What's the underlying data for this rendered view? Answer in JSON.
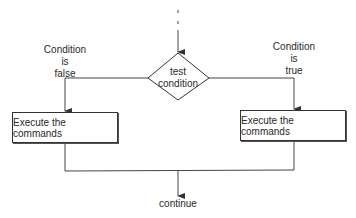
{
  "diagram": {
    "decision": {
      "line1": "test",
      "line2": "condition"
    },
    "false_branch": {
      "line1": "Condition",
      "line2": "is",
      "line3": "false",
      "action": "Execute the commands"
    },
    "true_branch": {
      "line1": "Condition",
      "line2": "is",
      "line3": "true",
      "action": "Execute the commands"
    },
    "end_label": "continue"
  }
}
